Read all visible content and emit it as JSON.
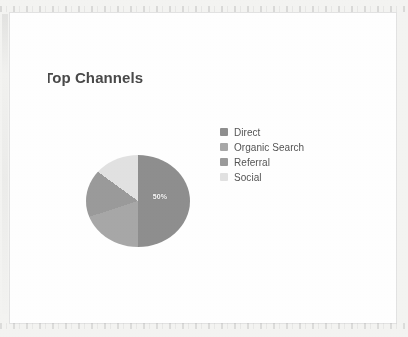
{
  "card": {
    "title": "Top Channels"
  },
  "legend": {
    "items": [
      {
        "label": "Direct",
        "color": "#8f8f8f"
      },
      {
        "label": "Organic Search",
        "color": "#a8a8a8"
      },
      {
        "label": "Referral",
        "color": "#9b9b9b"
      },
      {
        "label": "Social",
        "color": "#e2e2e2"
      }
    ]
  },
  "pie": {
    "label": "50%"
  },
  "chart_data": {
    "type": "pie",
    "title": "Top Channels",
    "xlabel": "",
    "ylabel": "",
    "legend_position": "right",
    "grid": false,
    "categories": [
      "Direct",
      "Organic Search",
      "Referral",
      "Social"
    ],
    "values": [
      50,
      20,
      15,
      15
    ],
    "value_unit": "%",
    "colors": [
      "#8f8f8f",
      "#a8a8a8",
      "#9b9b9b",
      "#e2e2e2"
    ],
    "data_labels": [
      "50%",
      "",
      "",
      ""
    ],
    "annotations": [
      "50%"
    ],
    "start_angle_deg": 0,
    "direction": "clockwise"
  }
}
